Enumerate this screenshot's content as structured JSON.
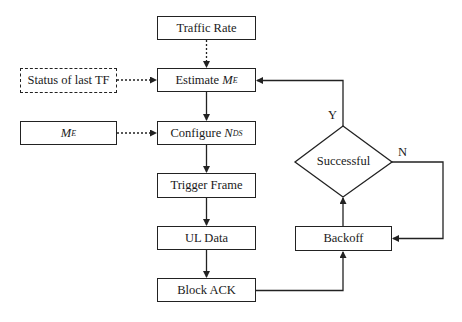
{
  "diagram": {
    "type": "flowchart",
    "nodes": {
      "traffic_rate": {
        "label": "Traffic Rate"
      },
      "status_last_tf": {
        "label": "Status of last TF",
        "style": "dashed"
      },
      "estimate": {
        "label": "Estimate ",
        "var": "M",
        "sub": "E"
      },
      "me_input": {
        "var": "M",
        "sub": "E"
      },
      "configure": {
        "label": "Configure ",
        "var": "N",
        "sub": "DS"
      },
      "trigger_frame": {
        "label": "Trigger Frame"
      },
      "ul_data": {
        "label": "UL Data"
      },
      "block_ack": {
        "label": "Block ACK"
      },
      "backoff": {
        "label": "Backoff"
      },
      "successful": {
        "label": "Successful",
        "shape": "diamond"
      }
    },
    "edge_labels": {
      "yes": "Y",
      "no": "N"
    },
    "edges": [
      {
        "from": "traffic_rate",
        "to": "estimate",
        "style": "dotted"
      },
      {
        "from": "status_last_tf",
        "to": "estimate",
        "style": "dotted"
      },
      {
        "from": "estimate",
        "to": "configure",
        "style": "solid"
      },
      {
        "from": "me_input",
        "to": "configure",
        "style": "dotted"
      },
      {
        "from": "configure",
        "to": "trigger_frame",
        "style": "solid"
      },
      {
        "from": "trigger_frame",
        "to": "ul_data",
        "style": "solid"
      },
      {
        "from": "ul_data",
        "to": "block_ack",
        "style": "solid"
      },
      {
        "from": "block_ack",
        "to": "backoff",
        "style": "solid"
      },
      {
        "from": "backoff",
        "to": "successful",
        "style": "solid"
      },
      {
        "from": "successful",
        "to": "estimate",
        "label": "Y",
        "style": "solid"
      },
      {
        "from": "successful",
        "to": "backoff",
        "label": "N",
        "style": "solid"
      }
    ]
  }
}
